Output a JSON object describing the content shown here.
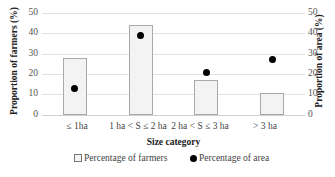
{
  "chart_data": {
    "type": "bar",
    "title": "",
    "xlabel": "Size category",
    "ylabel": "Proportion of farmers (%)",
    "y2label": "Proportion of area (%)",
    "categories": [
      "≤ 1ha",
      "1 ha < S ≤ 2 ha",
      "2 ha < S ≤ 3 ha",
      "> 3 ha"
    ],
    "series": [
      {
        "name": "Percentage of farmers",
        "kind": "bar",
        "axis": "left",
        "values": [
          28,
          44,
          17,
          11
        ]
      },
      {
        "name": "Percentage of area",
        "kind": "scatter",
        "axis": "right",
        "values": [
          13,
          39,
          21,
          27
        ]
      }
    ],
    "ylim": [
      0,
      50
    ],
    "y2lim": [
      0,
      50
    ],
    "yticks": [
      "0",
      "10",
      "20",
      "30",
      "40",
      "50"
    ],
    "grid": true,
    "legend_position": "bottom"
  },
  "legend": {
    "farmers": "Percentage of farmers",
    "area": "Percentage of area"
  }
}
